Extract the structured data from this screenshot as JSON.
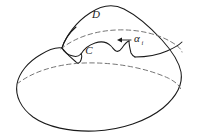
{
  "figure": {
    "kind": "geometry-diagram",
    "background_color": "#ffffff",
    "line_color": "#1a1a1a",
    "hidden_line_color": "#6e6e6e",
    "labels": [
      {
        "id": "region-d",
        "text": "D",
        "x": 96,
        "y": 18,
        "style": "italic"
      },
      {
        "id": "curve-c",
        "text": "C",
        "x": 89,
        "y": 54,
        "style": "italic"
      },
      {
        "id": "angle-alpha",
        "text": "α",
        "subscript": "i",
        "x": 134,
        "y": 42,
        "style": "italic"
      }
    ],
    "annotations": {
      "arrow": {
        "name": "alpha-pointer-arrow",
        "direction": "left",
        "from_x": 131,
        "from_y": 40,
        "to_x": 117,
        "to_y": 40
      }
    }
  }
}
